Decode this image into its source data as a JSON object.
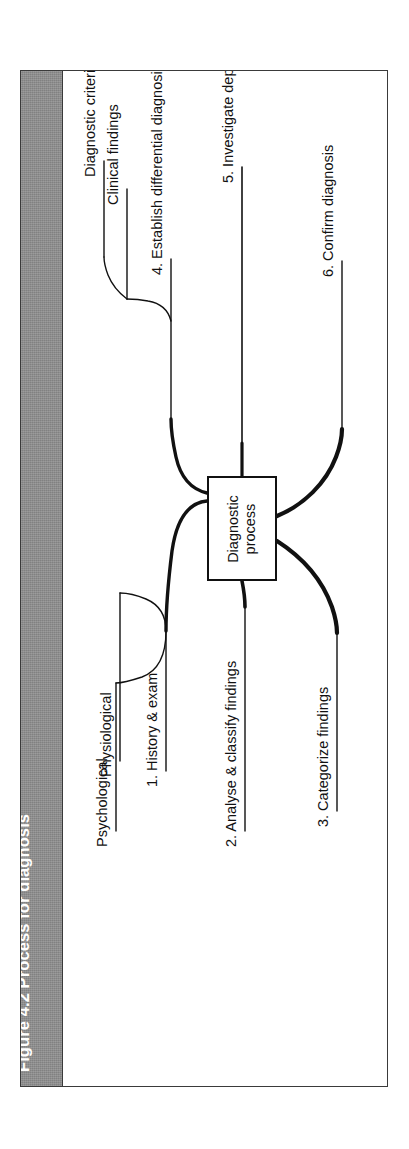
{
  "figure": {
    "title": "Figure 4.2 Process for diagnosis",
    "title_band_color": "#8e8e8e",
    "frame_color": "#3a3a3a",
    "background_color": "#ffffff"
  },
  "diagram": {
    "type": "mind-map",
    "orientation": "rotated-90-ccw",
    "central_node": {
      "line1": "Diagnostic",
      "line2": "process"
    },
    "branches": [
      {
        "id": "b1",
        "label": "1. History & exam"
      },
      {
        "id": "b2",
        "label": "2. Analyse & classify findings"
      },
      {
        "id": "b3",
        "label": "3. Categorize findings"
      },
      {
        "id": "b4",
        "label": "4. Establish differential diagnosis"
      },
      {
        "id": "b5",
        "label": "5. Investigate depending on differential diagnosis"
      },
      {
        "id": "b6",
        "label": "6. Confirm diagnosis"
      }
    ],
    "sub_branches": [
      {
        "id": "s1",
        "parent": "b1",
        "label": "Physiological"
      },
      {
        "id": "s2",
        "parent": "b1",
        "label": "Psychological"
      },
      {
        "id": "s3",
        "parent": "b4",
        "label": "Diagnostic criteria"
      },
      {
        "id": "s4",
        "parent": "b4",
        "label": "Clinical findings"
      }
    ]
  }
}
